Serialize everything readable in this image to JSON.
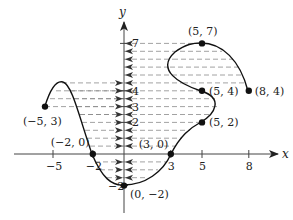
{
  "figure": {
    "type": "function-graph-range-projection",
    "axis_labels": {
      "x": "x",
      "y": "y"
    },
    "x_ticks": [
      {
        "value": -5,
        "label": "−5"
      },
      {
        "value": -2,
        "label": "−2"
      },
      {
        "value": 3,
        "label": "3"
      },
      {
        "value": 5,
        "label": "5"
      },
      {
        "value": 8,
        "label": "8"
      }
    ],
    "y_ticks": [
      {
        "value": 7,
        "label": "7"
      },
      {
        "value": 4,
        "label": "4"
      },
      {
        "value": 3,
        "label": "3"
      },
      {
        "value": 2,
        "label": "2"
      },
      {
        "value": -2,
        "label": "−2"
      }
    ],
    "points": [
      {
        "x": -5,
        "y": 3,
        "label": "(−5, 3)"
      },
      {
        "x": -2,
        "y": 0,
        "label": "(−2, 0)"
      },
      {
        "x": 0,
        "y": -2,
        "label": "(0, −2)"
      },
      {
        "x": 3,
        "y": 0,
        "label": "(3, 0)"
      },
      {
        "x": 5,
        "y": 2,
        "label": "(5, 2)"
      },
      {
        "x": 5,
        "y": 4,
        "label": "(5, 4)"
      },
      {
        "x": 5,
        "y": 7,
        "label": "(5, 7)"
      },
      {
        "x": 8,
        "y": 4,
        "label": "(8, 4)"
      }
    ],
    "projection_lines": {
      "y_levels": [
        7,
        6.5,
        6,
        5.5,
        5,
        4.5,
        4,
        3.5,
        3,
        2.5,
        2,
        1.5,
        1,
        0.5,
        -0.5,
        -1,
        -1.5
      ],
      "left_arrow_levels": [
        4.5,
        4,
        3.5,
        3,
        2.5,
        2,
        1.5,
        1,
        0.5,
        -0.5,
        -1,
        -1.5
      ]
    },
    "colors": {
      "curve": "#111111",
      "axis": "#444444",
      "dash": "#8a8a8a",
      "arrow": "#333333"
    }
  }
}
